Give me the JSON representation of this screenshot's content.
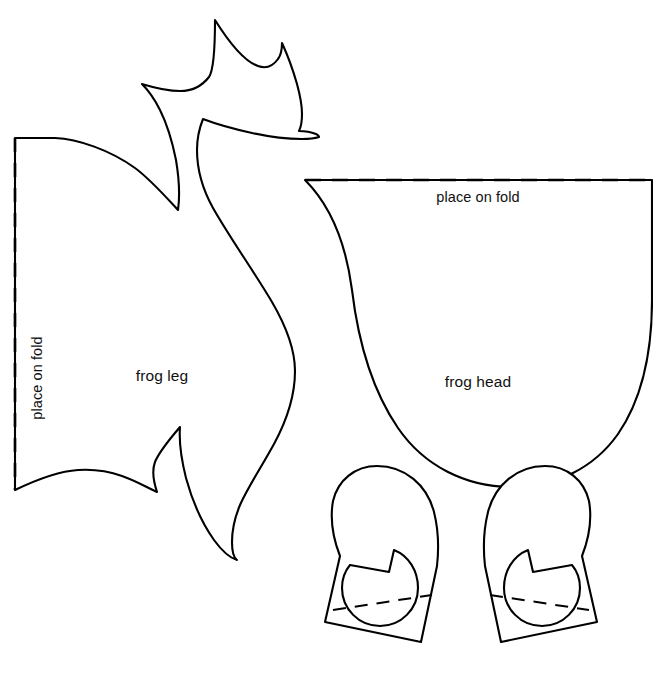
{
  "document": {
    "type": "sewing-pattern-template",
    "title": "Frog felt pattern pieces",
    "background_color": "#ffffff",
    "line_color": "#000000"
  },
  "pieces": [
    {
      "id": "frog-leg",
      "label": "frog leg",
      "label_x": 162,
      "label_y": 381,
      "fold_edge": "left-vertical",
      "fold_label": "place on fold",
      "fold_label_x": 42,
      "fold_label_y": 378
    },
    {
      "id": "frog-head",
      "label": "frog head",
      "label_x": 478,
      "label_y": 387,
      "fold_edge": "top-horizontal",
      "fold_label": "place on fold",
      "fold_label_x": 478,
      "fold_label_y": 202
    },
    {
      "id": "frog-eye-left",
      "label": "",
      "fold_edge": "bottom-dashed",
      "fold_label": ""
    },
    {
      "id": "frog-eye-right",
      "label": "",
      "fold_edge": "bottom-dashed",
      "fold_label": ""
    }
  ],
  "shapes": {
    "frog_leg_outline": "M 15,138 L 55,138 C 78,139 110,150 135,168 C 150,179 165,196 178,210 C 180,196 179,178 176,160 C 172,140 166,122 160,110 C 155,100 148,90 142,84 C 152,87 165,91 180,91 C 192,91 202,86 209,77 C 213,71 215,55 215,20 C 230,44 246,62 258,66 C 266,69 273,66 278,59 C 281,55 282,49 282,43 C 288,56 293,70 297,84 C 300,95 302,106 302,114 C 302,121 301,127 299,131 C 305,131 311,132 316,134 C 318,135 319,136 319,137 C 316,138 310,139 302,139 C 288,139 270,137 252,133 C 234,129 216,124 203,119 C 199,129 197,140 197,150 C 197,170 203,190 213,208 C 230,238 253,270 272,302 C 286,326 295,349 295,371 C 295,395 287,420 274,444 C 262,466 248,487 240,505 C 235,517 232,530 232,542 C 232,552 234,558 237,560 C 230,558 222,551 214,540 C 202,523 192,500 186,478 C 181,458 179,440 180,427 C 168,441 159,452 155,462 C 152,470 153,480 157,492 C 146,487 134,480 122,476 C 108,471 93,469 78,470 C 62,471 40,478 15,490 Z",
    "frog_leg_inner_curve": "M 178,210 C 180,196 179,178 176,160",
    "frog_head_outline": "M 305,180 L 652,180 L 652,300 C 652,358 640,402 618,434 C 594,468 556,487 512,487 C 466,487 424,466 398,428 C 372,390 358,340 352,290 C 346,244 330,205 305,180 Z",
    "eye_left_outline": "M 377,466 C 405,466 427,485 434,512 C 438,528 439,548 437,566 L 437,566 L 421,642 L 325,622 L 340,556 C 333,538 330,518 333,501 C 338,480 355,466 377,466 Z",
    "eye_left_pupil": "M 394,550 C 409,556 418,571 418,588 C 418,609 401,626 380,626 C 359,626 342,609 342,588 C 342,579 345,571 350,565 L 389,572 Z",
    "eye_left_fold": "M 333,610 L 432,595",
    "eye_right_outline": "M 545,466 C 567,466 584,480 589,501 C 592,518 589,538 582,556 L 597,622 L 501,642 L 485,566 C 483,548 484,528 488,512 C 495,485 517,466 545,466 Z",
    "eye_right_pupil": "M 528,550 L 533,572 L 572,565 C 577,571 580,579 580,588 C 580,609 563,626 542,626 C 521,626 504,609 504,588 C 504,571 513,556 528,550 Z",
    "eye_right_fold": "M 490,595 L 589,610"
  },
  "fold_lines": {
    "leg_vertical": {
      "x": 15,
      "y1": 138,
      "y2": 490,
      "dash": "14 11"
    },
    "head_horizontal": {
      "y": 180,
      "x1": 305,
      "x2": 652,
      "dash": "16 11"
    },
    "eye_dash": "13 9"
  }
}
